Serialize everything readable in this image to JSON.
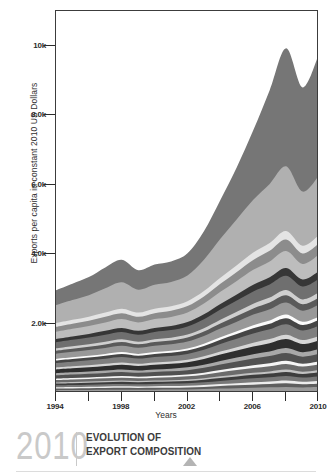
{
  "chart_data": {
    "type": "area",
    "title": "EVOLUTION OF EXPORT COMPOSITION",
    "xlabel": "Years",
    "ylabel": "Exports per capita in constant 2010 US Dollars",
    "xlim": [
      1994,
      2010
    ],
    "ylim": [
      0,
      11000
    ],
    "grid": false,
    "legend": "none",
    "stacked": true,
    "x": [
      1994,
      1995,
      1996,
      1997,
      1998,
      1999,
      2000,
      2001,
      2002,
      2003,
      2004,
      2005,
      2006,
      2007,
      2008,
      2009,
      2010
    ],
    "xticks": [
      1994,
      1998,
      2002,
      2006,
      2010
    ],
    "xtick_labels": [
      "1994",
      "1998",
      "2002",
      "2006",
      "2010"
    ],
    "xminorticks": [
      1996,
      2000,
      2004,
      2008
    ],
    "yticks": [
      2000,
      4000,
      6000,
      8000,
      10000
    ],
    "ytick_labels": [
      "2.0k",
      "4.0k",
      "6.0k",
      "8.0k",
      "10k"
    ],
    "series": [
      {
        "name": "layer-01",
        "color": "#9a9a9a",
        "values": [
          80,
          84,
          88,
          92,
          95,
          92,
          96,
          98,
          102,
          112,
          126,
          140,
          152,
          162,
          176,
          160,
          172
        ]
      },
      {
        "name": "layer-02",
        "color": "#5e5e5e",
        "values": [
          46,
          48,
          50,
          52,
          54,
          52,
          54,
          56,
          58,
          64,
          72,
          80,
          88,
          94,
          102,
          92,
          100
        ]
      },
      {
        "name": "layer-03",
        "color": "#ededed",
        "values": [
          36,
          38,
          40,
          42,
          44,
          42,
          44,
          46,
          48,
          52,
          58,
          64,
          70,
          76,
          82,
          74,
          80
        ]
      },
      {
        "name": "layer-04",
        "color": "#787878",
        "values": [
          58,
          60,
          62,
          65,
          68,
          66,
          68,
          70,
          74,
          82,
          92,
          102,
          112,
          120,
          130,
          118,
          128
        ]
      },
      {
        "name": "layer-05",
        "color": "#3d3d3d",
        "values": [
          52,
          54,
          56,
          58,
          60,
          58,
          60,
          62,
          66,
          72,
          82,
          90,
          100,
          106,
          116,
          104,
          114
        ]
      },
      {
        "name": "layer-06",
        "color": "#c2c2c2",
        "values": [
          30,
          32,
          33,
          34,
          36,
          34,
          36,
          37,
          40,
          44,
          50,
          55,
          60,
          64,
          70,
          64,
          68
        ]
      },
      {
        "name": "layer-07",
        "color": "#6b6b6b",
        "values": [
          70,
          73,
          76,
          80,
          84,
          80,
          84,
          86,
          92,
          102,
          116,
          128,
          140,
          150,
          162,
          148,
          158
        ]
      },
      {
        "name": "layer-08",
        "color": "#f5f5f5",
        "values": [
          40,
          42,
          44,
          46,
          48,
          46,
          48,
          50,
          52,
          58,
          66,
          72,
          80,
          86,
          92,
          84,
          90
        ]
      },
      {
        "name": "layer-09",
        "color": "#515151",
        "values": [
          96,
          100,
          104,
          110,
          116,
          110,
          115,
          120,
          126,
          140,
          158,
          176,
          192,
          206,
          222,
          202,
          216
        ]
      },
      {
        "name": "layer-10",
        "color": "#a8a8a8",
        "values": [
          62,
          64,
          67,
          70,
          74,
          70,
          74,
          76,
          80,
          90,
          102,
          112,
          124,
          132,
          143,
          130,
          140
        ]
      },
      {
        "name": "layer-11",
        "color": "#2e2e2e",
        "values": [
          110,
          116,
          121,
          128,
          134,
          128,
          134,
          138,
          146,
          162,
          184,
          204,
          224,
          240,
          258,
          234,
          250
        ]
      },
      {
        "name": "layer-12",
        "color": "#d6d6d6",
        "values": [
          54,
          56,
          58,
          62,
          65,
          62,
          65,
          67,
          70,
          78,
          88,
          98,
          108,
          116,
          125,
          114,
          122
        ]
      },
      {
        "name": "layer-13",
        "color": "#7f7f7f",
        "values": [
          130,
          136,
          143,
          150,
          158,
          150,
          158,
          162,
          172,
          192,
          216,
          240,
          264,
          282,
          304,
          276,
          296
        ]
      },
      {
        "name": "layer-14",
        "color": "#454545",
        "values": [
          74,
          78,
          81,
          86,
          90,
          86,
          90,
          92,
          98,
          108,
          124,
          136,
          150,
          160,
          173,
          158,
          168
        ]
      },
      {
        "name": "layer-15",
        "color": "#fbfbfb",
        "values": [
          44,
          46,
          48,
          50,
          53,
          50,
          53,
          54,
          58,
          64,
          72,
          80,
          88,
          94,
          102,
          92,
          99
        ]
      },
      {
        "name": "layer-16",
        "color": "#989898",
        "values": [
          150,
          158,
          165,
          174,
          182,
          174,
          182,
          188,
          198,
          222,
          250,
          278,
          306,
          326,
          352,
          320,
          342
        ]
      },
      {
        "name": "layer-17",
        "color": "#5a5a5a",
        "values": [
          88,
          92,
          96,
          101,
          106,
          101,
          106,
          109,
          116,
          128,
          146,
          162,
          178,
          190,
          205,
          186,
          199
        ]
      },
      {
        "name": "layer-18",
        "color": "#cfcfcf",
        "values": [
          66,
          69,
          72,
          76,
          80,
          76,
          80,
          82,
          87,
          97,
          110,
          122,
          134,
          143,
          154,
          140,
          150
        ]
      },
      {
        "name": "layer-19",
        "color": "#6f6f6f",
        "values": [
          175,
          184,
          192,
          203,
          213,
          203,
          213,
          219,
          232,
          258,
          292,
          324,
          356,
          380,
          410,
          373,
          399
        ]
      },
      {
        "name": "layer-20",
        "color": "#363636",
        "values": [
          95,
          100,
          104,
          110,
          115,
          110,
          115,
          118,
          126,
          140,
          158,
          176,
          193,
          206,
          222,
          202,
          216
        ]
      },
      {
        "name": "layer-21",
        "color": "#bdbdbd",
        "values": [
          210,
          220,
          230,
          243,
          255,
          243,
          255,
          262,
          278,
          310,
          350,
          388,
          427,
          456,
          492,
          447,
          478
        ]
      },
      {
        "name": "layer-22",
        "color": "#8c8c8c",
        "values": [
          140,
          147,
          153,
          162,
          170,
          162,
          170,
          175,
          185,
          206,
          233,
          259,
          284,
          304,
          328,
          298,
          319
        ]
      },
      {
        "name": "layer-23",
        "color": "#e4e4e4",
        "values": [
          105,
          110,
          115,
          121,
          127,
          121,
          127,
          131,
          139,
          155,
          175,
          194,
          213,
          228,
          246,
          224,
          239
        ]
      },
      {
        "name": "layer-24",
        "color": "#b0b0b0",
        "values": [
          520,
          570,
          620,
          700,
          760,
          660,
          690,
          700,
          740,
          900,
          1120,
          1320,
          1520,
          1700,
          1860,
          1560,
          1720
        ]
      },
      {
        "name": "layer-25",
        "color": "#767676",
        "values": [
          430,
          470,
          520,
          600,
          650,
          560,
          580,
          590,
          640,
          820,
          1120,
          1500,
          2000,
          2700,
          3400,
          3000,
          3500
        ]
      }
    ],
    "totals": [
      1462,
      1548,
      1632,
      1780,
      1869,
      1681,
      1751,
      1789,
      1911,
      2324,
      2931,
      3588,
      4327,
      5173,
      6093,
      5434,
      6126
    ],
    "annotations": []
  },
  "axes": {
    "ylabel": "Exports per capita in constant 2010 US Dollars",
    "xlabel": "Years"
  },
  "footer": {
    "year": "2010",
    "title_line1": "EVOLUTION OF",
    "title_line2": "EXPORT COMPOSITION"
  }
}
